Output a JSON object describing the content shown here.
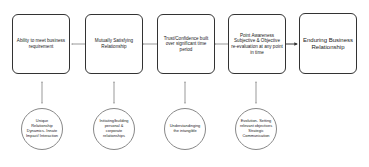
{
  "boxes": [
    {
      "label": "Ability to meet business requirement"
    },
    {
      "label": "Mutually Satisfying Relationship"
    },
    {
      "label": "Trust/Confidence built over significant time period"
    },
    {
      "label": "Point Awareness Subjective & Objective re-evaluation at any point in time"
    },
    {
      "label": "Enduring Business Relationship"
    }
  ],
  "circles": [
    {
      "label": "Unique Relationship Dynamics- Innate Impact/ Interaction"
    },
    {
      "label": "Initiating/building personal & corporate relationships"
    },
    {
      "label": "Understandinging the intangible"
    },
    {
      "label": "Evolution- Setting relevant objectives Strategic Communication"
    }
  ],
  "colors": {
    "stroke": "#333333",
    "circle_stroke": "#888888",
    "background": "#ffffff"
  }
}
